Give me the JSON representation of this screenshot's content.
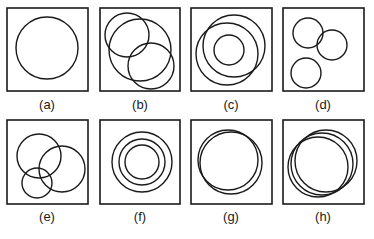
{
  "figure": {
    "stroke_color": "#1a1a1a",
    "background": "#ffffff",
    "panels": [
      {
        "label": "(a)",
        "box": {
          "x": 7,
          "y": 8,
          "w": 81,
          "h": 83
        },
        "label_pos": {
          "x": 47,
          "y": 97
        },
        "circles": [
          {
            "cx": 47,
            "cy": 48,
            "r": 31
          }
        ]
      },
      {
        "label": "(b)",
        "box": {
          "x": 100,
          "y": 8,
          "w": 80,
          "h": 83
        },
        "label_pos": {
          "x": 140,
          "y": 97
        },
        "circles": [
          {
            "cx": 127,
            "cy": 35,
            "r": 22
          },
          {
            "cx": 140,
            "cy": 50,
            "r": 31
          },
          {
            "cx": 151,
            "cy": 66,
            "r": 23
          }
        ]
      },
      {
        "label": "(c)",
        "box": {
          "x": 191,
          "y": 8,
          "w": 81,
          "h": 83
        },
        "label_pos": {
          "x": 231,
          "y": 97
        },
        "circles": [
          {
            "cx": 229,
            "cy": 50,
            "r": 15
          },
          {
            "cx": 234,
            "cy": 46,
            "r": 31
          },
          {
            "cx": 227,
            "cy": 54,
            "r": 31
          }
        ]
      },
      {
        "label": "(d)",
        "box": {
          "x": 283,
          "y": 8,
          "w": 81,
          "h": 83
        },
        "label_pos": {
          "x": 323,
          "y": 97
        },
        "circles": [
          {
            "cx": 308,
            "cy": 33,
            "r": 15
          },
          {
            "cx": 332,
            "cy": 45,
            "r": 15
          },
          {
            "cx": 306,
            "cy": 73,
            "r": 15
          }
        ]
      },
      {
        "label": "(e)",
        "box": {
          "x": 7,
          "y": 120,
          "w": 81,
          "h": 84
        },
        "label_pos": {
          "x": 47,
          "y": 209
        },
        "circles": [
          {
            "cx": 39,
            "cy": 156,
            "r": 22
          },
          {
            "cx": 62,
            "cy": 169,
            "r": 23
          },
          {
            "cx": 37,
            "cy": 183,
            "r": 15
          }
        ]
      },
      {
        "label": "(f)",
        "box": {
          "x": 100,
          "y": 120,
          "w": 80,
          "h": 84
        },
        "label_pos": {
          "x": 140,
          "y": 209
        },
        "circles": [
          {
            "cx": 142,
            "cy": 162,
            "r": 30
          },
          {
            "cx": 142,
            "cy": 162,
            "r": 23
          },
          {
            "cx": 142,
            "cy": 162,
            "r": 17
          }
        ]
      },
      {
        "label": "(g)",
        "box": {
          "x": 191,
          "y": 120,
          "w": 81,
          "h": 84
        },
        "label_pos": {
          "x": 231,
          "y": 209
        },
        "circles": [
          {
            "cx": 228,
            "cy": 160,
            "r": 30
          },
          {
            "cx": 231,
            "cy": 163,
            "r": 31
          }
        ]
      },
      {
        "label": "(h)",
        "box": {
          "x": 283,
          "y": 120,
          "w": 81,
          "h": 84
        },
        "label_pos": {
          "x": 323,
          "y": 209
        },
        "circles": [
          {
            "cx": 318,
            "cy": 167,
            "r": 30
          },
          {
            "cx": 322,
            "cy": 164,
            "r": 31
          },
          {
            "cx": 326,
            "cy": 161,
            "r": 31
          }
        ]
      }
    ]
  }
}
